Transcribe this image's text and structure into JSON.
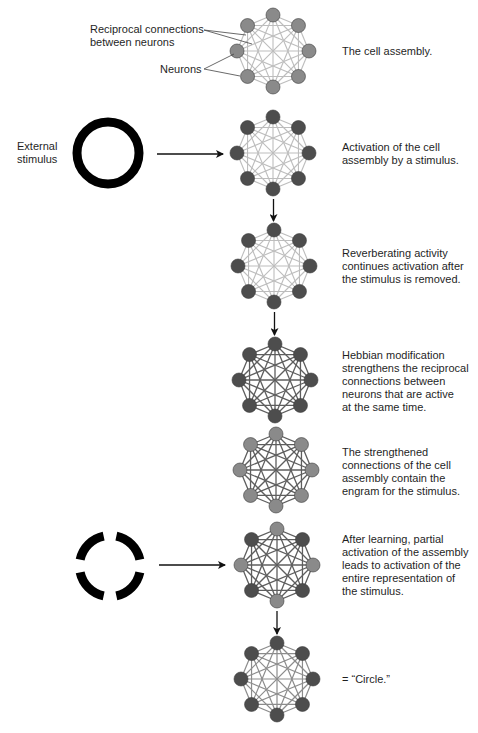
{
  "labels": {
    "connections": [
      "Reciprocal connections",
      "between neurons"
    ],
    "neurons": "Neurons",
    "external_stimulus": [
      "External",
      "stimulus"
    ]
  },
  "colors": {
    "node_active": "#4d4d4d",
    "node_inactive": "#8a8a8a",
    "edge_weak": "#bdbdbd",
    "edge_strong": "#5e5e5e",
    "edge_medium": "#8c8c8c",
    "stimulus": "#000000",
    "arrow": "#111111"
  },
  "stages": [
    {
      "id": "cell-assembly",
      "caption": [
        "The cell assembly."
      ],
      "node_states": [
        "inactive",
        "inactive",
        "inactive",
        "inactive",
        "inactive",
        "inactive",
        "inactive",
        "inactive"
      ],
      "edge_strength": "weak",
      "stimulus": null
    },
    {
      "id": "activation",
      "caption": [
        "Activation of the cell",
        "assembly by a stimulus."
      ],
      "node_states": [
        "active",
        "active",
        "active",
        "active",
        "active",
        "active",
        "active",
        "active"
      ],
      "edge_strength": "weak",
      "stimulus": "full-circle"
    },
    {
      "id": "reverberation",
      "caption": [
        "Reverberating activity",
        "continues activation after",
        "the stimulus is removed."
      ],
      "node_states": [
        "active",
        "active",
        "active",
        "active",
        "active",
        "active",
        "active",
        "active"
      ],
      "edge_strength": "weak",
      "stimulus": null
    },
    {
      "id": "hebbian-modification",
      "caption": [
        "Hebbian modification",
        "strengthens the reciprocal",
        "connections between",
        "neurons that are active",
        "at the same time."
      ],
      "node_states": [
        "active",
        "active",
        "active",
        "active",
        "active",
        "active",
        "active",
        "active"
      ],
      "edge_strength": "strong",
      "stimulus": null
    },
    {
      "id": "engram",
      "caption": [
        "The strengthened",
        "connections of the cell",
        "assembly contain the",
        "engram for the stimulus."
      ],
      "node_states": [
        "inactive",
        "inactive",
        "inactive",
        "inactive",
        "inactive",
        "inactive",
        "inactive",
        "inactive"
      ],
      "edge_strength": "strong",
      "stimulus": null
    },
    {
      "id": "partial-activation",
      "caption": [
        "After learning, partial",
        "activation of the assembly",
        "leads to activation of the",
        "entire representation of",
        "the stimulus."
      ],
      "node_states": [
        "inactive",
        "active",
        "inactive",
        "active",
        "inactive",
        "active",
        "inactive",
        "active"
      ],
      "edge_strength": "strong",
      "stimulus": "broken-circle"
    },
    {
      "id": "circle-recall",
      "caption": [
        "= “Circle.”"
      ],
      "node_states": [
        "active",
        "active",
        "active",
        "active",
        "active",
        "active",
        "active",
        "active"
      ],
      "edge_strength": "medium",
      "stimulus": null
    }
  ],
  "flow_arrows": [
    {
      "from": "activation",
      "to": "reverberation"
    },
    {
      "from": "reverberation",
      "to": "hebbian-modification"
    },
    {
      "from": "partial-activation",
      "to": "circle-recall"
    }
  ]
}
